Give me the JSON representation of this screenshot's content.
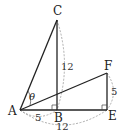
{
  "diagram": {
    "points": {
      "A": "A",
      "B": "B",
      "C": "C",
      "E": "E",
      "F": "F"
    },
    "angle_label": "θ",
    "lengths": {
      "BC": "12",
      "AB": "5",
      "AE": "12",
      "EF": "5"
    },
    "right_angles": [
      "B",
      "E"
    ],
    "segments": [
      "AC",
      "CB",
      "AB",
      "BE",
      "AF",
      "EF"
    ]
  }
}
